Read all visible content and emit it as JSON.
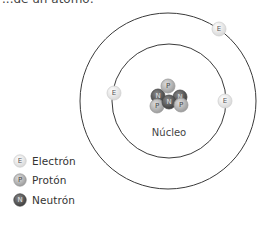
{
  "header": {
    "partial_text": "...de un átomo:"
  },
  "diagram": {
    "nucleus_label": "Núcleo",
    "orbits": [
      {
        "name": "inner-orbit",
        "cx": 169,
        "cy": 101,
        "r": 57
      },
      {
        "name": "outer-orbit",
        "cx": 168,
        "cy": 101,
        "r": 88
      }
    ],
    "electrons": [
      {
        "letter": "E",
        "cx": 114,
        "cy": 93
      },
      {
        "letter": "E",
        "cx": 225,
        "cy": 101
      },
      {
        "letter": "E",
        "cx": 219,
        "cy": 29
      }
    ],
    "nucleus_particles": [
      {
        "type": "neutron",
        "letter": "N",
        "cx": 158,
        "cy": 96
      },
      {
        "type": "proton",
        "letter": "P",
        "cx": 168,
        "cy": 86
      },
      {
        "type": "neutron",
        "letter": "N",
        "cx": 180,
        "cy": 97
      },
      {
        "type": "proton",
        "letter": "P",
        "cx": 157,
        "cy": 106
      },
      {
        "type": "neutron",
        "letter": "N",
        "cx": 169,
        "cy": 102
      },
      {
        "type": "proton",
        "letter": "P",
        "cx": 181,
        "cy": 105
      }
    ],
    "colors": {
      "electron_fill": "#ececec",
      "electron_stroke": "#d0d0d0",
      "electron_text": "#555555",
      "proton_fill": "#bdbdbd",
      "proton_stroke": "#9a9a9a",
      "proton_text": "#444444",
      "neutron_fill": "#6b6b6b",
      "neutron_stroke": "#4a4a4a",
      "neutron_text": "#e0e0e0",
      "orbit_stroke": "#3a3a3a"
    }
  },
  "legend": {
    "items": [
      {
        "type": "electron",
        "letter": "E",
        "label": "Electrón"
      },
      {
        "type": "proton",
        "letter": "P",
        "label": "Protón"
      },
      {
        "type": "neutron",
        "letter": "N",
        "label": "Neutrón"
      }
    ]
  }
}
